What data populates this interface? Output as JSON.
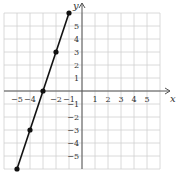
{
  "chart_data": {
    "type": "line",
    "title": "",
    "xlabel": "x",
    "ylabel": "y",
    "xlim": [
      -6,
      6
    ],
    "ylim": [
      -6,
      6
    ],
    "grid": true,
    "x_ticks": [
      -5,
      -4,
      -2,
      -1,
      1,
      2,
      3,
      4,
      5
    ],
    "y_ticks": [
      5,
      4,
      3,
      2,
      1,
      -1,
      -2,
      -3,
      -4,
      -5
    ],
    "series": [
      {
        "name": "y = 3x + 9",
        "points": [
          [
            -1,
            6
          ],
          [
            -2,
            3
          ],
          [
            -3,
            0
          ],
          [
            -4,
            -3
          ],
          [
            -5,
            -6
          ]
        ]
      }
    ]
  }
}
